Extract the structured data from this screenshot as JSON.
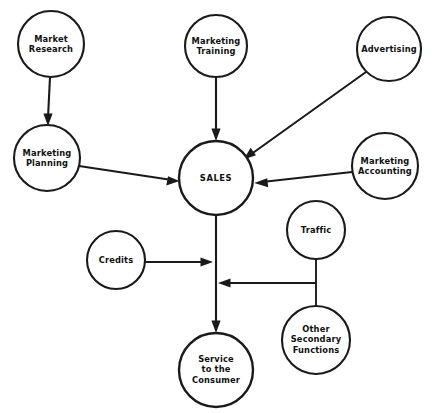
{
  "diagram": {
    "background_color": "#ffffff",
    "line_color": "#1a1a1a",
    "nodes": [
      {
        "id": "market_research",
        "label": "Market\nResearch",
        "cx": 51,
        "cy": 44,
        "r": 33
      },
      {
        "id": "marketing_training",
        "label": "Marketing\nTraining",
        "cx": 216,
        "cy": 46,
        "r": 31
      },
      {
        "id": "advertising",
        "label": "Advertising",
        "cx": 389,
        "cy": 49,
        "r": 32
      },
      {
        "id": "marketing_planning",
        "label": "Marketing\nPlanning",
        "cx": 47,
        "cy": 158,
        "r": 33
      },
      {
        "id": "sales",
        "label": "SALES",
        "cx": 216,
        "cy": 178,
        "r": 37
      },
      {
        "id": "marketing_accounting",
        "label": "Marketing\nAccounting",
        "cx": 385,
        "cy": 166,
        "r": 33
      },
      {
        "id": "traffic",
        "label": "Traffic",
        "cx": 316,
        "cy": 230,
        "r": 29
      },
      {
        "id": "credits",
        "label": "Credits",
        "cx": 116,
        "cy": 260,
        "r": 29
      },
      {
        "id": "other_secondary",
        "label": "Other\nSecondary\nFunctions",
        "cx": 316,
        "cy": 340,
        "r": 34
      },
      {
        "id": "service_consumer",
        "label": "Service\nto the\nConsumer",
        "cx": 216,
        "cy": 370,
        "r": 37
      }
    ],
    "edges": [
      {
        "id": "market_research_to_marketing_planning",
        "from": "market_research",
        "to": "marketing_planning",
        "arrow": true
      },
      {
        "id": "marketing_planning_to_sales",
        "from": "marketing_planning",
        "to": "sales",
        "arrow": true
      },
      {
        "id": "marketing_training_to_sales",
        "from": "marketing_training",
        "to": "sales",
        "arrow": true
      },
      {
        "id": "advertising_to_sales",
        "from": "advertising",
        "to": "sales",
        "arrow": true
      },
      {
        "id": "marketing_accounting_to_sales",
        "from": "marketing_accounting",
        "to": "sales",
        "arrow": true
      },
      {
        "id": "sales_to_service_consumer",
        "from": "sales",
        "to": "service_consumer",
        "arrow": true
      },
      {
        "id": "credits_to_trunk",
        "from": "credits",
        "to": "sales_trunk",
        "arrow": true
      },
      {
        "id": "traffic_to_junction",
        "from": "traffic",
        "to": "secondary_junction",
        "arrow": false
      },
      {
        "id": "other_secondary_to_junction",
        "from": "other_secondary",
        "to": "secondary_junction",
        "arrow": false
      },
      {
        "id": "secondary_junction_to_trunk",
        "from": "secondary_junction",
        "to": "sales_trunk",
        "arrow": true
      }
    ],
    "caption": ""
  }
}
